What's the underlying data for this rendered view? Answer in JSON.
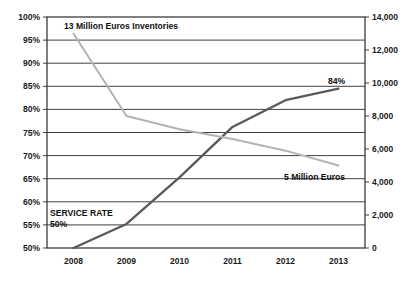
{
  "chart_data": {
    "type": "line",
    "title": "",
    "xlabel": "",
    "ylabel": "",
    "grid": true,
    "legend": "none",
    "x": [
      2008,
      2009,
      2010,
      2011,
      2012,
      2013
    ],
    "x_tick_labels": [
      "2008",
      "2009",
      "2010",
      "2011",
      "2012",
      "2013"
    ],
    "axes": {
      "left": {
        "name": "Service Rate",
        "ylim": [
          50,
          100
        ],
        "tick_values": [
          50,
          55,
          60,
          65,
          70,
          75,
          80,
          85,
          90,
          95,
          100
        ],
        "tick_labels": [
          "50%",
          "55%",
          "60%",
          "65%",
          "70%",
          "75%",
          "80%",
          "85%",
          "90%",
          "95%",
          "100%"
        ]
      },
      "right": {
        "name": "Inventories (Euros)",
        "ylim": [
          0,
          14000
        ],
        "tick_values": [
          0,
          2000,
          4000,
          6000,
          8000,
          10000,
          12000,
          14000
        ],
        "tick_labels": [
          "0",
          "2,000",
          "4,000",
          "6,000",
          "8,000",
          "10,000",
          "12,000",
          "14,000"
        ]
      }
    },
    "series": [
      {
        "name": "Service Rate",
        "axis": "left",
        "color": "#595959",
        "values": [
          50,
          55.2,
          65.3,
          76.2,
          82.0,
          84.5
        ]
      },
      {
        "name": "Inventories",
        "axis": "right",
        "color": "#b3b3b3",
        "values": [
          13000,
          8000,
          7200,
          6600,
          5900,
          5000
        ]
      }
    ],
    "annotations": [
      {
        "id": "inventories-start-label",
        "text": "13 Million Euros Inventories",
        "x_px": 64,
        "y_px": 29,
        "anchor": "start"
      },
      {
        "id": "service-rate-end-label",
        "text": "84%",
        "x_px": 328,
        "y_px": 84,
        "anchor": "start"
      },
      {
        "id": "inventories-end-label",
        "text": "5 Million Euros",
        "x_px": 284,
        "y_px": 180,
        "anchor": "start"
      },
      {
        "id": "service-rate-start-label-line1",
        "text": "SERVICE RATE",
        "x_px": 50,
        "y_px": 216,
        "anchor": "start"
      },
      {
        "id": "service-rate-start-label-line2",
        "text": "50%",
        "x_px": 50,
        "y_px": 227,
        "anchor": "start"
      }
    ]
  }
}
